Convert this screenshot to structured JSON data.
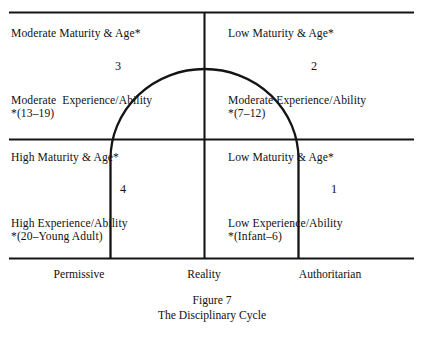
{
  "figure": {
    "caption_title": "Figure 7",
    "caption_subtitle": "The Disciplinary Cycle",
    "colors": {
      "ink": "#111111",
      "background": "#ffffff",
      "rule": "#141414"
    }
  },
  "axis": {
    "left_label": "Permissive",
    "center_label": "Reality",
    "right_label": "Authoritarian"
  },
  "quadrants": [
    {
      "id": "quadrant-3",
      "position": "top-left",
      "number": "3",
      "maturity_line": "Moderate Maturity & Age*",
      "experience_line": "Moderate  Experience/Ability",
      "age_range_line": "*(13–19)"
    },
    {
      "id": "quadrant-2",
      "position": "top-right",
      "number": "2",
      "maturity_line": "Low Maturity & Age*",
      "experience_line": "Moderate Experience/Ability",
      "age_range_line": "*(7–12)"
    },
    {
      "id": "quadrant-4",
      "position": "bottom-left",
      "number": "4",
      "maturity_line": "High Maturity & Age*",
      "experience_line": "High Experience/Ability",
      "age_range_line": "*(20–Young Adult)"
    },
    {
      "id": "quadrant-1",
      "position": "bottom-right",
      "number": "1",
      "maturity_line": "Low Maturity & Age*",
      "experience_line": "Low Experience/Ability",
      "age_range_line": "*(Infant–6)"
    }
  ]
}
